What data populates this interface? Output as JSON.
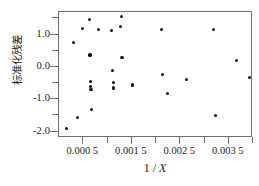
{
  "chart_data": {
    "type": "scatter",
    "title": "",
    "xlabel": "1 / X",
    "ylabel": "标准化残差",
    "xlim": [
      0.0,
      0.004
    ],
    "ylim": [
      -2.2,
      1.7
    ],
    "grid": false,
    "legend": null,
    "x_tick_labels": [
      "0.000 5",
      "0.001 5",
      "0.002 5",
      "0.003 5"
    ],
    "x_tick_values": [
      0.0005,
      0.0015,
      0.0025,
      0.0035
    ],
    "x_minor_tick_values": [
      0.001,
      0.002,
      0.003,
      0.004
    ],
    "y_tick_labels": [
      "1.0",
      "0.0",
      "-1.0",
      "-2.0"
    ],
    "y_tick_values": [
      1.0,
      0.0,
      -1.0,
      -2.0
    ],
    "y_minor_tick_values": [
      1.5,
      0.5,
      -0.5,
      -1.5
    ],
    "marker": "filled-circle",
    "marker_color": "#111111",
    "points": [
      {
        "x": 0.00016,
        "y": -1.9
      },
      {
        "x": 0.0003,
        "y": 0.75
      },
      {
        "x": 0.00038,
        "y": -1.57
      },
      {
        "x": 0.00048,
        "y": 1.2
      },
      {
        "x": 0.00063,
        "y": 1.47
      },
      {
        "x": 0.00064,
        "y": 0.37
      },
      {
        "x": 0.00065,
        "y": -0.44
      },
      {
        "x": 0.00065,
        "y": -0.6
      },
      {
        "x": 0.00066,
        "y": -0.7
      },
      {
        "x": 0.00067,
        "y": -1.33
      },
      {
        "x": 0.00082,
        "y": 1.15
      },
      {
        "x": 0.00109,
        "y": 1.13
      },
      {
        "x": 0.0011,
        "y": -0.11
      },
      {
        "x": 0.00112,
        "y": -0.48
      },
      {
        "x": 0.00113,
        "y": -0.65
      },
      {
        "x": 0.00126,
        "y": 1.25
      },
      {
        "x": 0.00129,
        "y": 1.57
      },
      {
        "x": 0.0013,
        "y": 0.3
      },
      {
        "x": 0.00151,
        "y": -0.56
      },
      {
        "x": 0.00211,
        "y": 1.17
      },
      {
        "x": 0.00214,
        "y": -0.24
      },
      {
        "x": 0.00223,
        "y": -0.83
      },
      {
        "x": 0.00263,
        "y": -0.4
      },
      {
        "x": 0.00318,
        "y": 1.17
      },
      {
        "x": 0.00323,
        "y": -1.5
      },
      {
        "x": 0.00366,
        "y": 0.2
      },
      {
        "x": 0.00392,
        "y": -0.33
      }
    ]
  }
}
